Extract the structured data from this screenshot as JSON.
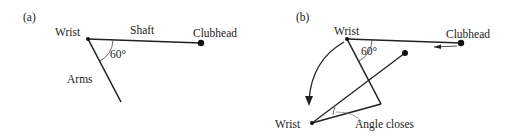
{
  "panel_a": {
    "tag": "(a)",
    "wrist": "Wrist",
    "shaft": "Shaft",
    "clubhead": "Clubhead",
    "angle": "60°",
    "arms": "Arms"
  },
  "panel_b": {
    "tag": "(b)",
    "wrist_top": "Wrist",
    "clubhead": "Clubhead",
    "angle": "60°",
    "wrist_bottom": "Wrist",
    "angle_closes": "Angle closes"
  }
}
